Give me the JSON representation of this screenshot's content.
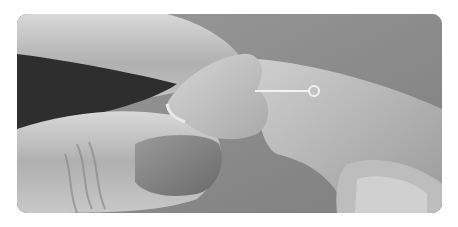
{
  "image": {
    "alt": "Grayscale photo of two hands holding a heart-shaped clay piece pierced by an eye pin",
    "style": "grayscale",
    "background": "#ffffff",
    "tones": {
      "backdrop": "#8e8e8e",
      "skin_light": "#d2d2d2",
      "skin_mid": "#a8a8a8",
      "shadow": "#2a2a2a",
      "heart": "#c4c4c4",
      "pin": "#f2f2f2"
    }
  }
}
